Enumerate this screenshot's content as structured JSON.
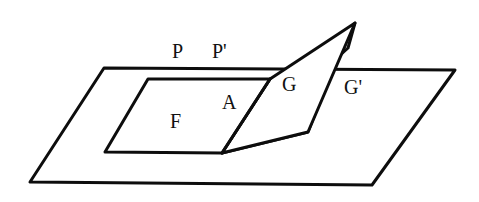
{
  "figure": {
    "background_color": "#ffffff",
    "stroke_color": "#0d0d0d",
    "fill_color": "#ffffff",
    "width": 479,
    "height": 202,
    "labels": {
      "p": "P",
      "p_prime": "P'",
      "f": "F",
      "a": "A",
      "g": "G",
      "g_prime": "G'"
    },
    "shapes": {
      "base_plane_name": "base-plane",
      "base_plane_points": "104,68 30,182 372,185 455,70",
      "base_plane_stroke_width": 3,
      "face_f_name": "face-F",
      "face_f_points": "148,79 270,79 222,153 105,152",
      "face_f_stroke_width": 3,
      "face_g_name": "face-G",
      "face_g_points": "270,79 355,23 308,132 222,153",
      "face_g_stroke_width": 3,
      "face_gprime_name": "face-G-prime",
      "face_gprime_points": "222,153 308,132 337,58 348,48 355,23",
      "face_gprime_stroke_width": 3,
      "fold_edge_name": "fold-edge-A",
      "fold_edge_points": "222,153 270,79"
    }
  }
}
